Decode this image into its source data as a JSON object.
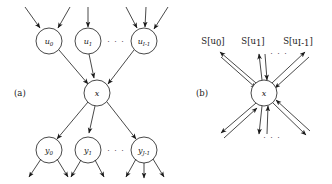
{
  "figure": {
    "background": "#ffffff",
    "stroke_color": "#1a1a1a",
    "panels": [
      {
        "id": "a",
        "label": "(a)",
        "label_pos": {
          "x": 14,
          "y": 96
        },
        "description": "directed graphical model: parents u feed node x, node x feeds children y",
        "nodes": [
          {
            "name": "u0",
            "base": "u",
            "sub": "0",
            "cx": 49,
            "cy": 41,
            "r": 13
          },
          {
            "name": "u1",
            "base": "u",
            "sub": "1",
            "cx": 88,
            "cy": 41,
            "r": 13
          },
          {
            "name": "uI1",
            "base": "u",
            "sub": "I-1",
            "cx": 144,
            "cy": 41,
            "r": 13
          },
          {
            "name": "x",
            "base": "x",
            "sub": "",
            "cx": 97,
            "cy": 93,
            "r": 13
          },
          {
            "name": "y0",
            "base": "y",
            "sub": "0",
            "cx": 49,
            "cy": 150,
            "r": 13
          },
          {
            "name": "y1",
            "base": "y",
            "sub": "1",
            "cx": 88,
            "cy": 150,
            "r": 13
          },
          {
            "name": "yJ1",
            "base": "y",
            "sub": "J-1",
            "cx": 144,
            "cy": 150,
            "r": 13
          }
        ],
        "ellipses": [
          {
            "text": "· · ·",
            "x": 116,
            "y": 44
          },
          {
            "text": "· · ·",
            "x": 116,
            "y": 153
          }
        ],
        "internal_edges": [
          {
            "from": "u0",
            "to": "x"
          },
          {
            "from": "u1",
            "to": "x"
          },
          {
            "from": "uI1",
            "to": "x"
          },
          {
            "from": "x",
            "to": "y0"
          },
          {
            "from": "x",
            "to": "y1"
          },
          {
            "from": "x",
            "to": "yJ1"
          }
        ],
        "external_in": {
          "u0": 2,
          "u1": 1,
          "uI1": 3
        },
        "external_out": {
          "y0": 2,
          "y1": 2,
          "yJ1": 3
        }
      },
      {
        "id": "b",
        "label": "(b)",
        "label_pos": {
          "x": 196,
          "y": 96
        },
        "description": "message passing view: bidirectional message arrows S[u] around node x",
        "nodes": [
          {
            "name": "x",
            "base": "x",
            "sub": "",
            "cx": 264,
            "cy": 93,
            "r": 13
          }
        ],
        "messages": [
          {
            "name": "S[u0]",
            "label": "S[u",
            "sub": "0",
            "close": "]",
            "x": 213,
            "y": 44
          },
          {
            "name": "S[u1]",
            "label": "S[u",
            "sub": "1",
            "close": "]",
            "x": 253,
            "y": 44
          },
          {
            "name": "S[uI1]",
            "label": "S[u",
            "sub": "I-1",
            "close": "]",
            "x": 298,
            "y": 44
          }
        ],
        "ellipses": [
          {
            "text": "· · ·",
            "x": 277,
            "y": 56
          },
          {
            "text": "· · ·",
            "x": 271,
            "y": 138
          }
        ],
        "upper_arrow_count": 3,
        "lower_arrow_count": 3
      }
    ]
  }
}
